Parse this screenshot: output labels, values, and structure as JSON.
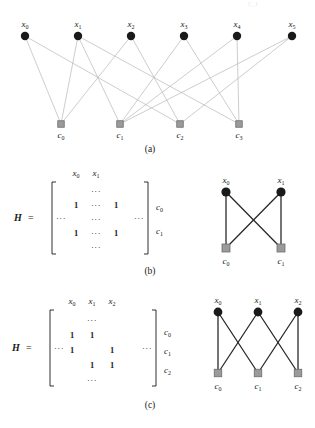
{
  "figure": {
    "title_faint": "C_1",
    "background": "#ffffff",
    "colors": {
      "variable_node": "#1a1a1a",
      "check_node_fill": "#9a9a9a",
      "check_node_stroke": "#6e6e6e",
      "edge_light": "#b8b8b8",
      "edge_dark": "#2a2a2a",
      "text": "#1a1a1a"
    }
  },
  "panel_a": {
    "caption": "(a)",
    "variable_labels": [
      "x",
      "x",
      "x",
      "x",
      "x",
      "x"
    ],
    "variable_subs": [
      "0",
      "1",
      "2",
      "3",
      "4",
      "5"
    ],
    "check_labels": [
      "c",
      "c",
      "c",
      "c"
    ],
    "check_subs": [
      "0",
      "1",
      "2",
      "3"
    ],
    "variable_x": [
      25,
      78,
      131,
      184,
      237,
      292
    ],
    "variable_y": 36,
    "check_x": [
      61,
      120,
      180,
      239
    ],
    "check_y": 124,
    "edges": [
      [
        0,
        0
      ],
      [
        0,
        2
      ],
      [
        1,
        0
      ],
      [
        1,
        1
      ],
      [
        1,
        3
      ],
      [
        2,
        0
      ],
      [
        2,
        2
      ],
      [
        3,
        1
      ],
      [
        3,
        3
      ],
      [
        4,
        1
      ],
      [
        4,
        3
      ],
      [
        5,
        1
      ],
      [
        5,
        2
      ]
    ]
  },
  "panel_b": {
    "caption": "(b)",
    "matrix": {
      "symbol": "H",
      "equals": "=",
      "left_ellipsis": "···",
      "right_ellipsis": "···",
      "col_headers": [
        "x",
        "x"
      ],
      "col_header_subs": [
        "0",
        "1"
      ],
      "row_labels": [
        "c",
        "c"
      ],
      "row_label_subs": [
        "0",
        "1"
      ],
      "rows": [
        [
          "",
          "···",
          ""
        ],
        [
          "1",
          "···",
          "1"
        ],
        [
          "",
          "···",
          ""
        ],
        [
          "1",
          "···",
          "1"
        ],
        [
          "",
          "···",
          ""
        ]
      ]
    },
    "graph": {
      "variable_labels": [
        "x",
        "x"
      ],
      "variable_subs": [
        "0",
        "1"
      ],
      "check_labels": [
        "c",
        "c"
      ],
      "check_subs": [
        "0",
        "1"
      ],
      "variable_x": [
        226,
        281
      ],
      "variable_y": 32,
      "check_x": [
        226,
        281
      ],
      "check_y": 88,
      "edges": [
        [
          0,
          0
        ],
        [
          0,
          1
        ],
        [
          1,
          0
        ],
        [
          1,
          1
        ]
      ]
    }
  },
  "panel_c": {
    "caption": "(c)",
    "matrix": {
      "symbol": "H",
      "equals": "=",
      "left_ellipsis": "···",
      "right_ellipsis": "···",
      "col_headers": [
        "x",
        "x",
        "x"
      ],
      "col_header_subs": [
        "0",
        "1",
        "2"
      ],
      "row_labels": [
        "c",
        "c",
        "c"
      ],
      "row_label_subs": [
        "0",
        "1",
        "2"
      ],
      "rows": [
        [
          "",
          "···",
          ""
        ],
        [
          "1",
          "1",
          ""
        ],
        [
          "1",
          "",
          "1"
        ],
        [
          "",
          "1",
          "1"
        ],
        [
          "",
          "···",
          ""
        ]
      ]
    },
    "graph": {
      "variable_labels": [
        "x",
        "x",
        "x"
      ],
      "variable_subs": [
        "0",
        "1",
        "2"
      ],
      "check_labels": [
        "c",
        "c",
        "c"
      ],
      "check_subs": [
        "0",
        "1",
        "2"
      ],
      "variable_x": [
        218,
        258,
        298
      ],
      "variable_y": 32,
      "check_x": [
        218,
        258,
        298
      ],
      "check_y": 93,
      "edges": [
        [
          0,
          0
        ],
        [
          0,
          1
        ],
        [
          1,
          0
        ],
        [
          1,
          2
        ],
        [
          2,
          1
        ],
        [
          2,
          2
        ]
      ]
    }
  }
}
